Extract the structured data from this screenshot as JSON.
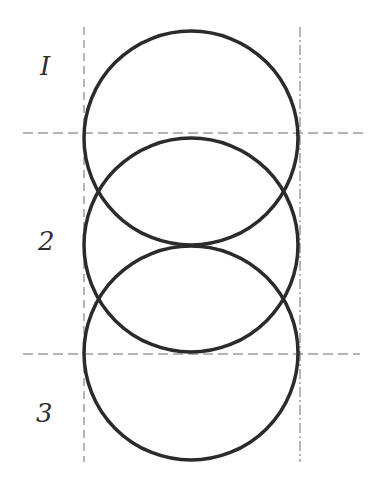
{
  "diagram": {
    "labels": [
      {
        "id": "zone-1",
        "text": "I"
      },
      {
        "id": "zone-2",
        "text": "2"
      },
      {
        "id": "zone-3",
        "text": "3"
      }
    ],
    "circles": [
      {
        "cx": 191,
        "cy": 138,
        "r": 107
      },
      {
        "cx": 191,
        "cy": 245,
        "r": 107
      },
      {
        "cx": 191,
        "cy": 353,
        "r": 107
      }
    ],
    "guides": {
      "vertical": [
        84,
        300
      ],
      "horizontal": [
        133,
        354
      ]
    },
    "colors": {
      "stroke": "#2b2b2b",
      "guide": "#6a6a6a",
      "background": "#ffffff"
    }
  }
}
